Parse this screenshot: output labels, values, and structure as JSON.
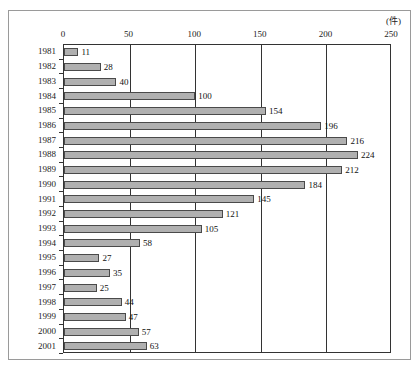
{
  "chart_data": {
    "type": "bar",
    "orientation": "horizontal",
    "title": "",
    "xlabel": "",
    "ylabel": "",
    "unit_label": "(件)",
    "xlim": [
      0,
      250
    ],
    "xticks": [
      0,
      50,
      100,
      150,
      200,
      250
    ],
    "grid": true,
    "legend": null,
    "categories": [
      "1981",
      "1982",
      "1983",
      "1984",
      "1985",
      "1986",
      "1987",
      "1988",
      "1989",
      "1990",
      "1991",
      "1992",
      "1993",
      "1994",
      "1995",
      "1996",
      "1997",
      "1998",
      "1999",
      "2000",
      "2001"
    ],
    "values": [
      11,
      28,
      40,
      100,
      154,
      196,
      216,
      224,
      212,
      184,
      145,
      121,
      105,
      58,
      27,
      35,
      25,
      44,
      47,
      57,
      63
    ],
    "data_labels": [
      "11",
      "28",
      "40",
      "100",
      "154",
      "196",
      "216",
      "224",
      "212",
      "184",
      "145",
      "121",
      "105",
      "58",
      "27",
      "35",
      "25",
      "44",
      "47",
      "57",
      "63"
    ],
    "colors": {
      "bar_fill": "#b0b0b0",
      "bar_stroke": "#4a4a4a",
      "axis": "#333333",
      "frame": "#9a9a9a",
      "background": "#ffffff",
      "text": "#1a1a1a"
    }
  }
}
